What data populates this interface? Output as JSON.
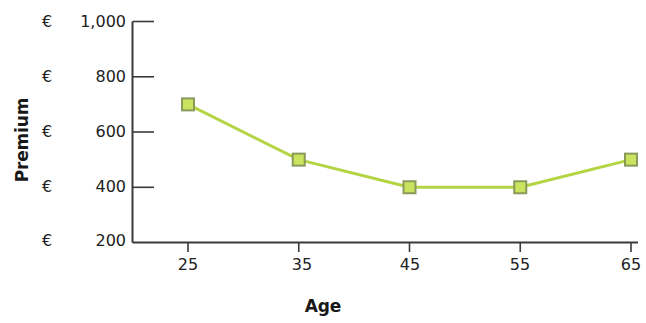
{
  "chart_data": {
    "type": "line",
    "title": "",
    "xlabel": "Age",
    "ylabel": "Premium",
    "categories": [
      25,
      35,
      45,
      55,
      65
    ],
    "x_tick_labels": [
      "25",
      "35",
      "45",
      "55",
      "65"
    ],
    "y_tick_labels": [
      "€1,000",
      "€  800",
      "€  600",
      "€  400",
      "€  200"
    ],
    "y_tick_currency": [
      "€",
      "€",
      "€",
      "€",
      "€"
    ],
    "y_tick_values": [
      1000,
      800,
      600,
      400,
      200
    ],
    "ylim": [
      200,
      1000
    ],
    "xlim": [
      25,
      65
    ],
    "grid": false,
    "legend": false,
    "series": [
      {
        "name": "Premium",
        "values": [
          700,
          500,
          400,
          400,
          500
        ],
        "line_color": "#b4d444",
        "marker_fill": "#cbe35f",
        "marker_edge": "#8a9a5b",
        "marker": "square"
      }
    ]
  },
  "axis": {
    "line_color": "#3a3a3a",
    "y_axis_title": "Premium",
    "x_axis_title": "Age"
  }
}
